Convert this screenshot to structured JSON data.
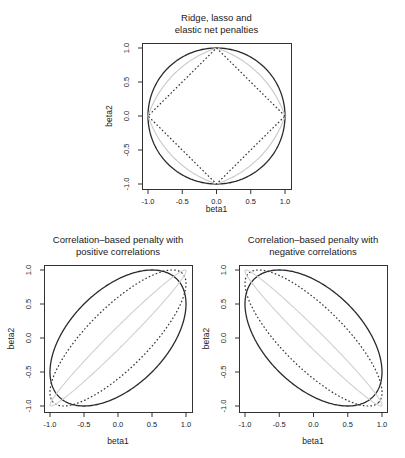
{
  "figure": {
    "width": 405,
    "height": 458,
    "background": "#ffffff"
  },
  "chart_data": [
    {
      "type": "line",
      "id": "top",
      "title_lines": [
        "Ridge, lasso and",
        "elastic net penalties"
      ],
      "xlabel": "beta1",
      "ylabel": "beta2",
      "xlim": [
        -1.0,
        1.0
      ],
      "ylim": [
        -1.0,
        1.0
      ],
      "xticks": [
        -1.0,
        -0.5,
        0.0,
        0.5,
        1.0
      ],
      "xtick_labels": [
        "-1.0",
        "-0.5",
        "0.0",
        "0.5",
        "1.0"
      ],
      "yticks": [
        -1.0,
        -0.5,
        0.0,
        0.5,
        1.0
      ],
      "ytick_labels": [
        "-1.0",
        "-0.5",
        "0.0",
        "0.5",
        "1.0"
      ],
      "grid": false,
      "legend": null,
      "series": [
        {
          "name": "Ridge (L2 circle)",
          "shape": "lp_ball",
          "p": 2,
          "style": "solid",
          "color": "#2b2b2b",
          "width": 1.3
        },
        {
          "name": "Elastic net",
          "shape": "elastic_net",
          "alpha": 0.5,
          "style": "solid",
          "color": "#c8c8c8",
          "width": 1.1
        },
        {
          "name": "Lasso (L1 diamond)",
          "shape": "lp_ball",
          "p": 1,
          "style": "dotted",
          "color": "#333333",
          "width": 1.2
        }
      ]
    },
    {
      "type": "line",
      "id": "bottom_left",
      "title_lines": [
        "Correlation–based penalty with",
        "positive correlations"
      ],
      "xlabel": "beta1",
      "ylabel": "beta2",
      "xlim": [
        -1.0,
        1.0
      ],
      "ylim": [
        -1.0,
        1.0
      ],
      "xticks": [
        -1.0,
        -0.5,
        0.0,
        0.5,
        1.0
      ],
      "xtick_labels": [
        "-1.0",
        "-0.5",
        "0.0",
        "0.5",
        "1.0"
      ],
      "yticks": [
        -1.0,
        -0.5,
        0.0,
        0.5,
        1.0
      ],
      "ytick_labels": [
        "-1.0",
        "-0.5",
        "0.0",
        "0.5",
        "1.0"
      ],
      "grid": false,
      "legend": null,
      "series": [
        {
          "name": "Correlation penalty rho=0.5",
          "shape": "corr_ellipse",
          "rho": 0.5,
          "style": "solid",
          "color": "#2b2b2b",
          "width": 1.3
        },
        {
          "name": "Correlation penalty rho=0.8",
          "shape": "corr_ellipse",
          "rho": 0.8,
          "style": "dotted",
          "color": "#333333",
          "width": 1.2
        },
        {
          "name": "Correlation penalty rho=0.99",
          "shape": "corr_ellipse",
          "rho": 0.985,
          "style": "solid",
          "color": "#d0d0d0",
          "width": 1.1
        }
      ]
    },
    {
      "type": "line",
      "id": "bottom_right",
      "title_lines": [
        "Correlation–based penalty with",
        "negative correlations"
      ],
      "xlabel": "beta1",
      "ylabel": "beta2",
      "xlim": [
        -1.0,
        1.0
      ],
      "ylim": [
        -1.0,
        1.0
      ],
      "xticks": [
        -1.0,
        -0.5,
        0.0,
        0.5,
        1.0
      ],
      "xtick_labels": [
        "-1.0",
        "-0.5",
        "0.0",
        "0.5",
        "1.0"
      ],
      "yticks": [
        -1.0,
        -0.5,
        0.0,
        0.5,
        1.0
      ],
      "ytick_labels": [
        "-1.0",
        "-0.5",
        "0.0",
        "0.5",
        "1.0"
      ],
      "grid": false,
      "legend": null,
      "series": [
        {
          "name": "Correlation penalty rho=-0.5",
          "shape": "corr_ellipse",
          "rho": -0.5,
          "style": "solid",
          "color": "#2b2b2b",
          "width": 1.3
        },
        {
          "name": "Correlation penalty rho=-0.8",
          "shape": "corr_ellipse",
          "rho": -0.8,
          "style": "dotted",
          "color": "#333333",
          "width": 1.2
        },
        {
          "name": "Correlation penalty rho=-0.99",
          "shape": "corr_ellipse",
          "rho": -0.985,
          "style": "solid",
          "color": "#d0d0d0",
          "width": 1.1
        }
      ]
    }
  ],
  "layout": {
    "panels": {
      "top": {
        "frame": [
          142,
          43,
          291,
          189
        ],
        "data_px_x": [
          148,
          285
        ],
        "data_px_y": [
          184,
          48
        ],
        "title_y": [
          21,
          33
        ],
        "xlabel_y": 212,
        "ylabel_x": 112,
        "ytick_label_x": 129
      },
      "bottom_left": {
        "frame": [
          44,
          265,
          192,
          412
        ],
        "data_px_x": [
          50,
          186
        ],
        "data_px_y": [
          406,
          270
        ],
        "title_y": [
          243,
          255
        ],
        "xlabel_y": 444,
        "ylabel_x": 14,
        "ytick_label_x": 31
      },
      "bottom_right": {
        "frame": [
          239,
          265,
          387,
          412
        ],
        "data_px_x": [
          245,
          382
        ],
        "data_px_y": [
          406,
          270
        ],
        "title_y": [
          243,
          255
        ],
        "xlabel_y": 444,
        "ylabel_x": 209,
        "ytick_label_x": 226
      }
    }
  }
}
